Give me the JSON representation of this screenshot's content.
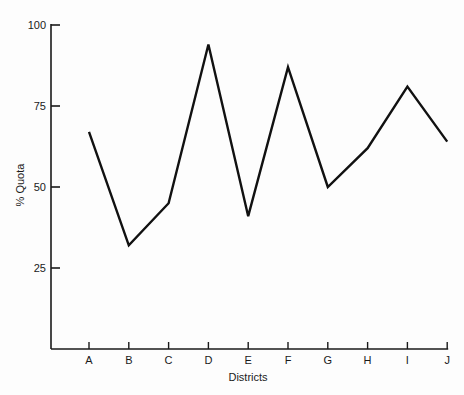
{
  "chart_data": {
    "type": "line",
    "title": "",
    "xlabel": "Districts",
    "ylabel": "% Quota",
    "categories": [
      "A",
      "B",
      "C",
      "D",
      "E",
      "F",
      "G",
      "H",
      "I",
      "J"
    ],
    "values": [
      67,
      32,
      45,
      94,
      41,
      87,
      50,
      62,
      81,
      64
    ],
    "ylim": [
      0,
      100
    ],
    "yticks": [
      25,
      50,
      75,
      100
    ],
    "grid": false,
    "legend": null
  },
  "colors": {
    "line": "#111111",
    "axis": "#1a1a1a",
    "background": "#fdfdfd"
  }
}
